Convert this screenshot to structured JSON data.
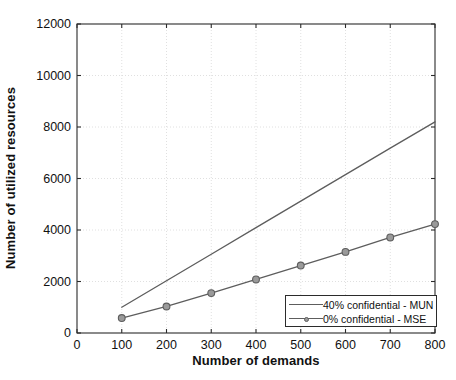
{
  "chart_data": {
    "type": "line",
    "title": "",
    "xlabel": "Number of demands",
    "ylabel": "Number of utilized resources",
    "xlim": [
      0,
      800
    ],
    "ylim": [
      0,
      12000
    ],
    "xticks": [
      "0",
      "100",
      "200",
      "300",
      "400",
      "500",
      "600",
      "700",
      "800"
    ],
    "yticks": [
      "0",
      "2000",
      "4000",
      "6000",
      "8000",
      "10000",
      "12000"
    ],
    "grid": true,
    "legend_position": "lower right",
    "x": [
      100,
      200,
      300,
      400,
      500,
      600,
      700,
      800
    ],
    "series": [
      {
        "name": "40% confidential - MUN",
        "marker": "none",
        "color": "#5d5d5d",
        "values": [
          1000,
          2030,
          3060,
          4090,
          5120,
          6150,
          7180,
          8200
        ]
      },
      {
        "name": "0% confidential - MSE",
        "marker": "circle",
        "color": "#5d5d5d",
        "marker_fill": "#9a9a9a",
        "values": [
          580,
          1030,
          1550,
          2080,
          2620,
          3150,
          3710,
          4230
        ]
      }
    ]
  },
  "legend": {
    "entries": [
      {
        "label": "40% confidential - MUN"
      },
      {
        "label": "0% confidential - MSE"
      }
    ]
  },
  "colors": {
    "axis": "#2b2b2b",
    "grid": "#d8d8d8",
    "line": "#5d5d5d",
    "marker_fill": "#9a9a9a",
    "background": "#ffffff"
  }
}
